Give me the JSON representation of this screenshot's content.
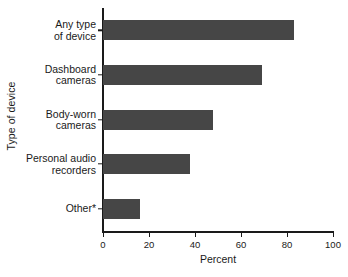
{
  "chart_data": {
    "type": "bar",
    "orientation": "horizontal",
    "title": "",
    "xlabel": "Percent",
    "ylabel": "Type of device",
    "categories": [
      "Any type\nof device",
      "Dashboard\ncameras",
      "Body-worn\ncameras",
      "Personal audio\nrecorders",
      "Other*"
    ],
    "values": [
      83,
      69,
      48,
      38,
      16
    ],
    "xlim": [
      0,
      100
    ],
    "xticks": [
      0,
      20,
      40,
      60,
      80,
      100
    ],
    "xtick_labels": [
      "0",
      "20",
      "40",
      "60",
      "80",
      "100"
    ],
    "grid": false,
    "legend": false,
    "bar_color": "#464646",
    "axis_color": "#1a1a1a",
    "background_color": "#ffffff"
  }
}
